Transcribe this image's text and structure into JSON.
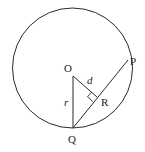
{
  "diagram": {
    "colors": {
      "stroke": "#2a2a2a",
      "background": "#ffffff"
    },
    "circle": {
      "cx": 72.5,
      "cy": 68,
      "r": 60
    },
    "points": {
      "O": {
        "label": "O",
        "x": 73,
        "y": 76
      },
      "Q": {
        "label": "Q",
        "x": 73,
        "y": 128
      },
      "P": {
        "label": "P",
        "x": 128,
        "y": 60
      },
      "R": {
        "label": "R",
        "x": 97,
        "y": 97
      }
    },
    "segment_labels": {
      "r": "r",
      "d": "d"
    }
  }
}
